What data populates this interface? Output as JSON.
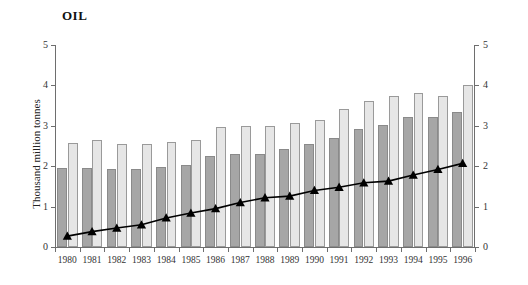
{
  "chart_data": {
    "type": "bar",
    "title": "OIL",
    "xlabel": "",
    "ylabel": "Thousand million tonnes",
    "ylim": [
      0,
      5
    ],
    "y_ticks": [
      0,
      1,
      2,
      3,
      4,
      5
    ],
    "right_axis": {
      "ylim": [
        0,
        5
      ],
      "y_ticks": [
        0,
        1,
        2,
        3,
        4,
        5
      ]
    },
    "grid": false,
    "legend": null,
    "categories": [
      "1980",
      "1981",
      "1982",
      "1983",
      "1984",
      "1986",
      "1985",
      "1987",
      "1988",
      "1989",
      "1990",
      "1991",
      "1992",
      "1993",
      "1994",
      "1995",
      "1996"
    ],
    "x": [
      "1980",
      "1981",
      "1982",
      "1983",
      "1984",
      "1985",
      "1986",
      "1987",
      "1988",
      "1989",
      "1990",
      "1991",
      "1992",
      "1993",
      "1994",
      "1995",
      "1996"
    ],
    "series": [
      {
        "name": "dark-bars",
        "type": "bar",
        "color": "#a6a6a6",
        "values": [
          1.95,
          1.96,
          1.92,
          1.92,
          1.97,
          2.02,
          2.25,
          2.29,
          2.31,
          2.42,
          2.55,
          2.7,
          2.93,
          3.02,
          3.22,
          3.22,
          3.35
        ]
      },
      {
        "name": "light-bars",
        "type": "bar",
        "color": "#e6e6e6",
        "values": [
          2.58,
          2.66,
          2.54,
          2.56,
          2.6,
          2.66,
          2.98,
          3.0,
          3.0,
          3.08,
          3.14,
          3.42,
          3.62,
          3.73,
          3.82,
          3.74,
          4.0
        ]
      },
      {
        "name": "trend-line",
        "type": "line",
        "marker": "triangle",
        "color": "#000000",
        "values": [
          0.27,
          0.38,
          0.47,
          0.55,
          0.72,
          0.84,
          0.95,
          1.1,
          1.22,
          1.26,
          1.4,
          1.48,
          1.59,
          1.63,
          1.78,
          1.92,
          2.07
        ]
      }
    ]
  }
}
